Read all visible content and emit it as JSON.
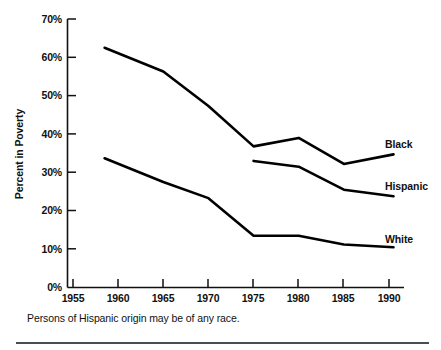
{
  "chart_data": {
    "type": "line",
    "title": "",
    "xlabel": "",
    "ylabel": "Percent in Poverty",
    "xlim": [
      1955,
      1991.5
    ],
    "ylim": [
      0,
      70
    ],
    "grid": false,
    "legend_position": "right-inline-end-of-line",
    "x_ticks": [
      "1955",
      "1960",
      "1965",
      "1970",
      "1975",
      "1980",
      "1985",
      "1990"
    ],
    "x_tick_values": [
      1955,
      1960,
      1965,
      1970,
      1975,
      1980,
      1985,
      1990
    ],
    "y_ticks": [
      "0%",
      "10%",
      "20%",
      "30%",
      "40%",
      "50%",
      "60%",
      "70%"
    ],
    "y_tick_values": [
      0,
      10,
      20,
      30,
      40,
      50,
      60,
      70
    ],
    "series": [
      {
        "name": "Black",
        "label": "Black",
        "color": "#000000",
        "x": [
          1958.5,
          1965,
          1970,
          1975,
          1980,
          1985,
          1990.5
        ],
        "values": [
          62.5,
          56.3,
          47.3,
          36.8,
          39.0,
          32.2,
          34.7
        ]
      },
      {
        "name": "Hispanic",
        "label": "Hispanic",
        "color": "#000000",
        "x": [
          1975,
          1980,
          1985,
          1990.5
        ],
        "values": [
          33.0,
          31.5,
          25.5,
          23.8
        ]
      },
      {
        "name": "White",
        "label": "White",
        "color": "#000000",
        "x": [
          1958.5,
          1965,
          1970,
          1975,
          1980,
          1985,
          1990.5
        ],
        "values": [
          33.7,
          27.5,
          23.3,
          13.5,
          13.5,
          11.2,
          10.5
        ]
      }
    ]
  },
  "axis": {
    "y_title": "Percent in Poverty"
  },
  "labels": {
    "black": "Black",
    "hispanic": "Hispanic",
    "white": "White"
  },
  "footnote": {
    "text": "Persons of Hispanic origin may be of any race."
  },
  "ytick_0": "0%",
  "ytick_10": "10%",
  "ytick_20": "20%",
  "ytick_30": "30%",
  "ytick_40": "40%",
  "ytick_50": "50%",
  "ytick_60": "60%",
  "ytick_70": "70%",
  "xtick_1955": "1955",
  "xtick_1960": "1960",
  "xtick_1965": "1965",
  "xtick_1970": "1970",
  "xtick_1975": "1975",
  "xtick_1980": "1980",
  "xtick_1985": "1985",
  "xtick_1990": "1990"
}
